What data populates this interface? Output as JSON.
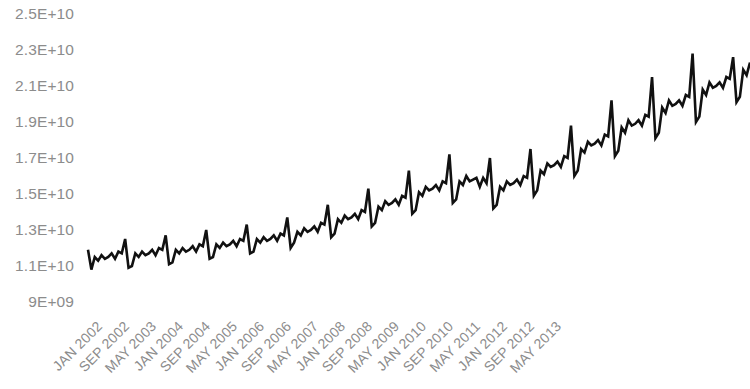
{
  "chart_data": {
    "type": "line",
    "title": "",
    "subtitle": "",
    "xlabel": "",
    "ylabel": "",
    "grid": false,
    "legend": null,
    "legend_position": "none",
    "ylim": [
      9000000000,
      25000000000
    ],
    "ytick_labels": [
      "2.5E+10",
      "2.3E+10",
      "2.1E+10",
      "1.9E+10",
      "1.7E+10",
      "1.5E+10",
      "1.3E+10",
      "1.1E+10",
      "9E+09"
    ],
    "ytick_values": [
      25000000000,
      23000000000,
      21000000000,
      19000000000,
      17000000000,
      15000000000,
      13000000000,
      11000000000,
      9000000000
    ],
    "xtick_labels": [
      "JAN 2002",
      "SEP 2002",
      "MAY 2003",
      "JAN 2004",
      "SEP 2004",
      "MAY 2005",
      "JAN 2006",
      "SEP 2006",
      "MAY 2007",
      "JAN 2008",
      "SEP 2008",
      "MAY 2009",
      "JAN 2010",
      "SEP 2010",
      "MAY 2011",
      "JAN 2012",
      "SEP 2012",
      "MAY 2013"
    ],
    "xtick_indices": [
      0,
      8,
      16,
      24,
      32,
      40,
      48,
      56,
      64,
      72,
      80,
      88,
      96,
      104,
      112,
      120,
      128,
      136
    ],
    "x_start": "JAN 2002",
    "x_interval": "monthly",
    "xtick_interval_months": 8,
    "series": [
      {
        "name": "series-1",
        "color": "#111111",
        "line_width": 2.6,
        "values": [
          11900000000,
          10800000000,
          11500000000,
          11300000000,
          11600000000,
          11400000000,
          11500000000,
          11700000000,
          11400000000,
          11800000000,
          11700000000,
          12500000000,
          10900000000,
          11000000000,
          11700000000,
          11500000000,
          11800000000,
          11600000000,
          11700000000,
          11900000000,
          11600000000,
          12000000000,
          11900000000,
          12700000000,
          11100000000,
          11200000000,
          11900000000,
          11700000000,
          12000000000,
          11800000000,
          11900000000,
          12100000000,
          11800000000,
          12200000000,
          12100000000,
          13000000000,
          11400000000,
          11500000000,
          12200000000,
          12000000000,
          12300000000,
          12100000000,
          12200000000,
          12400000000,
          12100000000,
          12500000000,
          12400000000,
          13300000000,
          11700000000,
          11800000000,
          12500000000,
          12300000000,
          12600000000,
          12400000000,
          12500000000,
          12700000000,
          12400000000,
          12800000000,
          12700000000,
          13700000000,
          12000000000,
          12300000000,
          12900000000,
          12700000000,
          13100000000,
          12900000000,
          13000000000,
          13200000000,
          12900000000,
          13400000000,
          13300000000,
          14400000000,
          12600000000,
          12800000000,
          13600000000,
          13400000000,
          13800000000,
          13600000000,
          13700000000,
          13900000000,
          13600000000,
          14100000000,
          14000000000,
          15300000000,
          13200000000,
          13400000000,
          14300000000,
          14100000000,
          14600000000,
          14400000000,
          14500000000,
          14700000000,
          14400000000,
          14900000000,
          14800000000,
          16300000000,
          13900000000,
          14100000000,
          15100000000,
          14900000000,
          15400000000,
          15200000000,
          15300000000,
          15500000000,
          15200000000,
          15700000000,
          15600000000,
          17200000000,
          14500000000,
          14700000000,
          15700000000,
          15500000000,
          16000000000,
          15700000000,
          15800000000,
          15900000000,
          15400000000,
          15900000000,
          15600000000,
          17000000000,
          14200000000,
          14400000000,
          15400000000,
          15200000000,
          15700000000,
          15500000000,
          15600000000,
          15800000000,
          15500000000,
          16000000000,
          15900000000,
          17500000000,
          14900000000,
          15200000000,
          16300000000,
          16100000000,
          16700000000,
          16500000000,
          16600000000,
          16800000000,
          16500000000,
          17100000000,
          17000000000,
          18800000000,
          16000000000,
          16300000000,
          17500000000,
          17300000000,
          17900000000,
          17700000000,
          17800000000,
          18000000000,
          17700000000,
          18300000000,
          18200000000,
          20200000000,
          17100000000,
          17400000000,
          18700000000,
          18400000000,
          19100000000,
          18800000000,
          18900000000,
          19100000000,
          18800000000,
          19400000000,
          19300000000,
          21500000000,
          18100000000,
          18400000000,
          19800000000,
          19500000000,
          20200000000,
          19900000000,
          20000000000,
          20200000000,
          19900000000,
          20500000000,
          20400000000,
          22800000000,
          19000000000,
          19300000000,
          20800000000,
          20500000000,
          21200000000,
          20900000000,
          21000000000,
          21200000000,
          20900000000,
          21500000000,
          21400000000,
          22600000000,
          20100000000,
          20400000000,
          21900000000,
          21600000000,
          22300000000
        ]
      }
    ]
  },
  "axes": {
    "y_axis_name": "value-axis",
    "x_axis_name": "time-axis"
  }
}
